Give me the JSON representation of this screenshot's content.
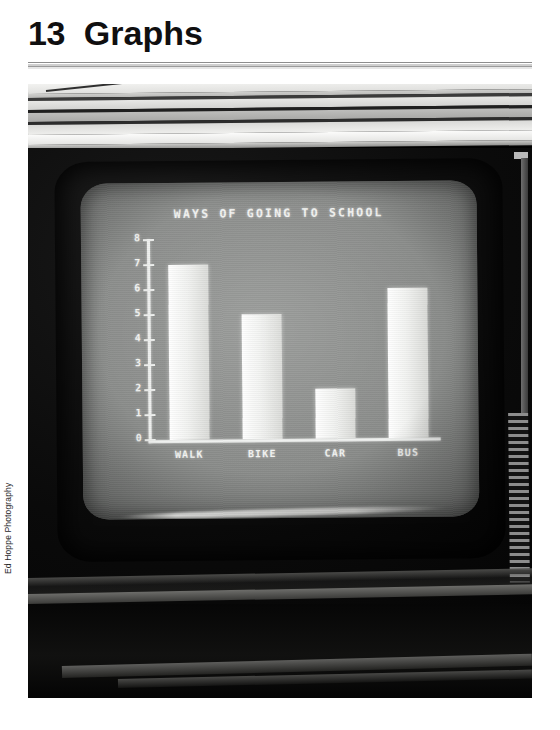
{
  "page": {
    "chapter_number": "13",
    "chapter_title": "Graphs",
    "photo_credit": "Ed Hoppe Photography"
  },
  "photo": {
    "subject": "television-displaying-bar-chart",
    "screen_color": "#8a8c8a",
    "cabinet_color": "#0a0a0a",
    "chart_ink_color": "#f2f3f1"
  },
  "chart_data": {
    "type": "bar",
    "title": "WAYS OF GOING TO SCHOOL",
    "categories": [
      "WALK",
      "BIKE",
      "CAR",
      "BUS"
    ],
    "values": [
      7,
      5,
      2,
      6
    ],
    "xlabel": "",
    "ylabel": "",
    "ylim": [
      0,
      8
    ],
    "ytick_labels": [
      "0",
      "1",
      "2",
      "3",
      "4",
      "5",
      "6",
      "7",
      "8"
    ],
    "ytick_values": [
      0,
      1,
      2,
      3,
      4,
      5,
      6,
      7,
      8
    ],
    "grid": false,
    "legend": false,
    "legend_position": "none",
    "bar_color": "#f2f3f1",
    "axis_color": "#eef0ee"
  }
}
